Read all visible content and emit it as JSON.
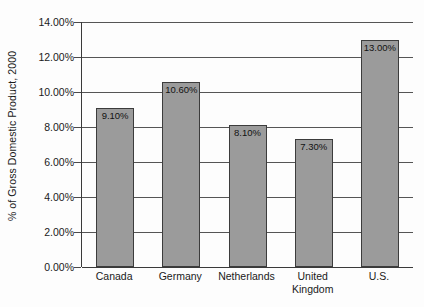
{
  "chart_data": {
    "type": "bar",
    "title": "",
    "xlabel": "",
    "ylabel": "% of Gross Domestic Product, 2000",
    "categories": [
      "Canada",
      "Germany",
      "Netherlands",
      "United Kingdom",
      "U.S."
    ],
    "category_lines": [
      [
        "Canada"
      ],
      [
        "Germany"
      ],
      [
        "Netherlands"
      ],
      [
        "United",
        "Kingdom"
      ],
      [
        "U.S."
      ]
    ],
    "values": [
      9.1,
      10.6,
      8.1,
      7.3,
      13.0
    ],
    "data_labels": [
      "9.10%",
      "10.60%",
      "8.10%",
      "7.30%",
      "13.00%"
    ],
    "ylim": [
      0,
      14
    ],
    "ytick_values": [
      0,
      2,
      4,
      6,
      8,
      10,
      12,
      14
    ],
    "ytick_labels": [
      "0.00%",
      "2.00%",
      "4.00%",
      "6.00%",
      "8.00%",
      "10.00%",
      "12.00%",
      "14.00%"
    ],
    "grid": true,
    "legend": false,
    "bar_color": "#9b9b9b",
    "bar_border_color": "#3c3c3c",
    "gridline_color": "#555555",
    "axis_color": "#3a3a3a",
    "background": "#fdfdfd"
  }
}
